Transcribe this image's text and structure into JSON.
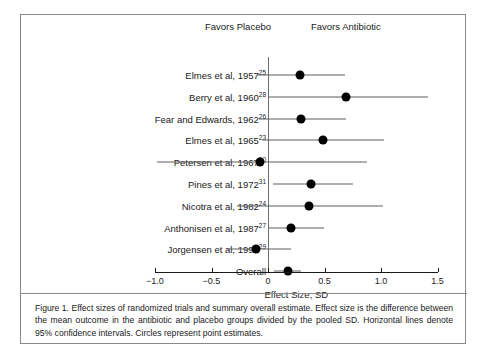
{
  "figure": {
    "caption": "Figure 1. Effect sizes of randomized trials and summary overall estimate. Effect size is the difference between the mean outcome in the antibiotic and placebo groups divided by the pooled SD. Horizontal lines denote 95% confidence intervals. Circles represent point estimates."
  },
  "headers": {
    "left": "Favors Placebo",
    "right": "Favors Antibiotic"
  },
  "chart_data": {
    "type": "scatter",
    "subtype": "forest-plot",
    "title": "",
    "xlabel": "Effect Size, SD",
    "ylabel": "",
    "xlim": [
      -1.0,
      1.5
    ],
    "xticks": [
      -1.0,
      -0.5,
      0,
      0.5,
      1.0,
      1.5
    ],
    "xticklabels": [
      "−1.0",
      "−0.5",
      "0",
      "0.5",
      "1.0",
      "1.5"
    ],
    "grid": false,
    "legend": null,
    "reference_line": 0,
    "annotations": [
      "Favors Placebo",
      "Favors Antibiotic"
    ],
    "categories": [
      "Elmes et al, 1957",
      "Berry et al, 1960",
      "Fear and Edwards, 1962",
      "Elmes et al, 1965",
      "Petersen et al, 1967",
      "Pines et al, 1972",
      "Nicotra et al, 1982",
      "Anthonisen et al, 1987",
      "Jorgensen et al, 1992",
      "Overall"
    ],
    "rows": [
      {
        "label": "Elmes et al, 1957",
        "ref": "25",
        "estimate": 0.28,
        "ci_low": -0.1,
        "ci_high": 0.68,
        "overall": false
      },
      {
        "label": "Berry et al, 1960",
        "ref": "28",
        "estimate": 0.69,
        "ci_low": 0.0,
        "ci_high": 1.42,
        "overall": false
      },
      {
        "label": "Fear and Edwards, 1962",
        "ref": "26",
        "estimate": 0.29,
        "ci_low": -0.08,
        "ci_high": 0.69,
        "overall": false
      },
      {
        "label": "Elmes et al, 1965",
        "ref": "23",
        "estimate": 0.49,
        "ci_low": -0.05,
        "ci_high": 1.03,
        "overall": false
      },
      {
        "label": "Petersen et al, 1967",
        "ref": "30",
        "estimate": -0.07,
        "ci_low": -0.98,
        "ci_high": 0.88,
        "overall": false
      },
      {
        "label": "Pines et al, 1972",
        "ref": "31",
        "estimate": 0.38,
        "ci_low": 0.04,
        "ci_high": 0.75,
        "overall": false
      },
      {
        "label": "Nicotra et al, 1982",
        "ref": "24",
        "estimate": 0.36,
        "ci_low": -0.27,
        "ci_high": 1.02,
        "overall": false
      },
      {
        "label": "Anthonisen et al, 1987",
        "ref": "27",
        "estimate": 0.2,
        "ci_low": 0.01,
        "ci_high": 0.5,
        "overall": false
      },
      {
        "label": "Jorgensen et al, 1992",
        "ref": "29",
        "estimate": -0.11,
        "ci_low": -0.36,
        "ci_high": 0.2,
        "overall": false
      },
      {
        "label": "Overall",
        "ref": "",
        "estimate": 0.18,
        "ci_low": 0.05,
        "ci_high": 0.29,
        "overall": true
      }
    ]
  }
}
